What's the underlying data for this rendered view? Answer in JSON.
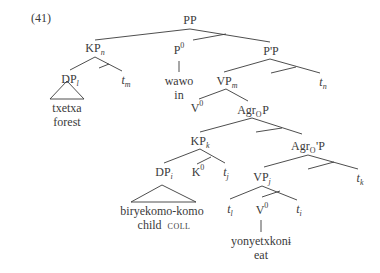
{
  "example_number": "(41)",
  "nodes": {
    "pp": {
      "base": "PP"
    },
    "kp_n": {
      "base": "KP",
      "sub": "n"
    },
    "p0": {
      "base": "P",
      "sup": "0"
    },
    "ppbar": {
      "base": "P'P"
    },
    "dp_l": {
      "base": "DP",
      "sub": "l"
    },
    "t_m": {
      "base": "t",
      "sub": "m"
    },
    "vp_m": {
      "base": "VP",
      "sub": "m"
    },
    "t_n": {
      "base": "t",
      "sub": "n"
    },
    "v0_upper": {
      "base": "V",
      "sup": "0"
    },
    "agrop": {
      "base": "Agr",
      "sub": "O",
      "tail": "P"
    },
    "kp_k": {
      "base": "KP",
      "sub": "k"
    },
    "agrobar": {
      "base": "Agr",
      "sub": "O",
      "tail": "'P"
    },
    "dp_i": {
      "base": "DP",
      "sub": "i"
    },
    "k0": {
      "base": "K",
      "sup": "0"
    },
    "t_j": {
      "base": "t",
      "sub": "j"
    },
    "vp_j": {
      "base": "VP",
      "sub": "j"
    },
    "t_k": {
      "base": "t",
      "sub": "k"
    },
    "t_l": {
      "base": "t",
      "sub": "l"
    },
    "v0_lower": {
      "base": "V",
      "sup": "0"
    },
    "t_i": {
      "base": "t",
      "sub": "i"
    }
  },
  "leaves": {
    "txetxa": {
      "word": "txetxa",
      "gloss": "forest"
    },
    "wawo": {
      "word": "wawo",
      "gloss": "in"
    },
    "biryekomo": {
      "word": "biryekomo-komo",
      "gloss": "child",
      "gloss_tag": "COLL"
    },
    "yonyetxkoni": {
      "word": "yonyetxkonɨ",
      "gloss": "eat"
    }
  }
}
